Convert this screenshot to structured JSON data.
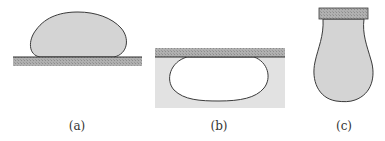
{
  "figure": {
    "panels": [
      {
        "id": "a",
        "label": "(a)",
        "description": "sessile drop resting on top of a solid substrate"
      },
      {
        "id": "b",
        "label": "(b)",
        "description": "bubble/drop beneath a substrate immersed in liquid"
      },
      {
        "id": "c",
        "label": "(c)",
        "description": "pendant drop hanging from a capillary tip"
      }
    ]
  },
  "colors": {
    "drop_fill": "#d4d4d4",
    "outline": "#3a3a3a",
    "substrate": "#a9a9a9",
    "liquid_bath": "#e2e2e2",
    "bubble_fill": "#ffffff",
    "label_text": "#333333"
  }
}
